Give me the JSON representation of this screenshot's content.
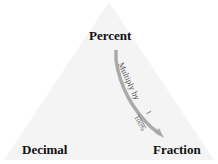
{
  "diagram": {
    "vertices": {
      "top": "Percent",
      "left": "Decimal",
      "right": "Fraction"
    },
    "arrow": {
      "text": "Multiply by",
      "fraction_num": "1",
      "fraction_den": "100%"
    },
    "colors": {
      "triangle_fill": "#f4f4f4",
      "arrow": "#aaaaaa",
      "text": "#111111",
      "arrow_text": "#555555"
    }
  }
}
